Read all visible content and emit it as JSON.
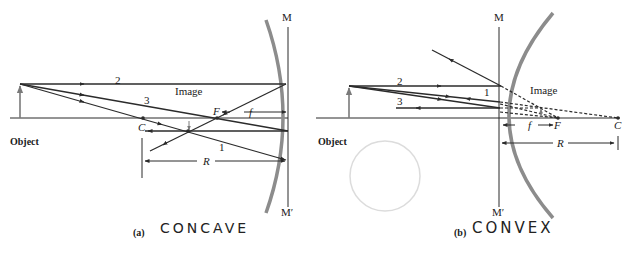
{
  "panel_a": {
    "caption_tag": "(a)",
    "handwritten_label": "CONCAVE",
    "object_label": "Object",
    "image_label": "Image",
    "mirror_top": "M",
    "mirror_bottom": "M′",
    "center_label": "C",
    "focus_label": "F",
    "focal_length_label": "f",
    "radius_label": "R",
    "ray_labels": [
      "1",
      "2",
      "3"
    ]
  },
  "panel_b": {
    "caption_tag": "(b)",
    "handwritten_label": "CONVEX",
    "object_label": "Object",
    "image_label": "Image",
    "mirror_top": "M",
    "mirror_bottom": "M′",
    "center_label": "C",
    "focus_label": "F",
    "focal_length_label": "f",
    "radius_label": "R",
    "ray_labels": [
      "1",
      "2",
      "3"
    ]
  },
  "colors": {
    "ray": "#2b2b2b",
    "mirror": "#8c8c8c",
    "object_arrow": "#7a7a7a",
    "text": "#1a1a1a"
  }
}
